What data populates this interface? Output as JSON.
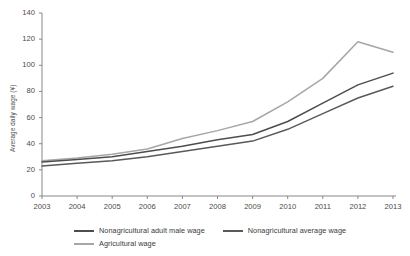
{
  "chart_data": {
    "type": "line",
    "title": "",
    "xlabel": "",
    "ylabel": "Average daily wage (¥)",
    "categories": [
      "2003",
      "2004",
      "2005",
      "2006",
      "2007",
      "2008",
      "2009",
      "2010",
      "2011",
      "2012",
      "2013"
    ],
    "x": [
      2003,
      2004,
      2005,
      2006,
      2007,
      2008,
      2009,
      2010,
      2011,
      2012,
      2013
    ],
    "xlim": [
      2003,
      2013
    ],
    "ylim": [
      0,
      140
    ],
    "yticks": [
      0,
      20,
      40,
      60,
      80,
      100,
      120,
      140
    ],
    "grid": false,
    "legend_position": "bottom",
    "series": [
      {
        "name": "Nonagricultural adult male wage",
        "color": "#4d4d4d",
        "values": [
          26,
          28,
          30,
          34,
          38,
          43,
          47,
          57,
          71,
          85,
          94
        ]
      },
      {
        "name": "Nonagricultural average wage",
        "color": "#595959",
        "values": [
          23,
          25,
          27,
          30,
          34,
          38,
          42,
          51,
          63,
          75,
          84
        ]
      },
      {
        "name": "Agricultural wage",
        "color": "#a6a6a6",
        "values": [
          27,
          29,
          32,
          36,
          44,
          50,
          57,
          72,
          90,
          118,
          110
        ]
      }
    ]
  },
  "axes": {
    "y_title": "Average daily wage (¥)",
    "y_tick_labels": [
      "140",
      "120",
      "100",
      "80",
      "60",
      "40",
      "20",
      "0"
    ],
    "x_tick_labels": [
      "2003",
      "2004",
      "2005",
      "2006",
      "2007",
      "2008",
      "2009",
      "2010",
      "2011",
      "2012",
      "2013"
    ]
  },
  "legend": {
    "items": [
      {
        "label": "Nonagricultural adult male wage",
        "color": "#4d4d4d"
      },
      {
        "label": "Nonagricultural average wage",
        "color": "#595959"
      },
      {
        "label": "Agricultural wage",
        "color": "#a6a6a6"
      }
    ]
  },
  "colors": {
    "axis": "#7a7a7a",
    "text": "#3a3a3a",
    "background": "#ffffff"
  }
}
